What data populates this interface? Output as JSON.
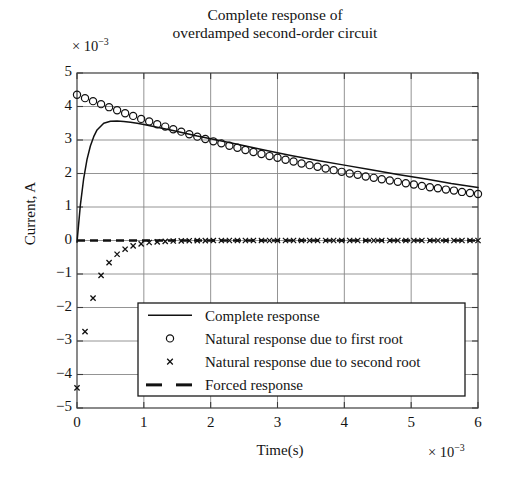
{
  "figure": {
    "title_lines": [
      "Complete response of",
      "overdamped second-order circuit"
    ],
    "y_multiplier": "× 10",
    "y_multiplier_exp": "−3",
    "x_multiplier": "× 10",
    "x_multiplier_exp": "−3",
    "xlabel": "Time(s)",
    "ylabel": "Current, A"
  },
  "axis": {
    "y_ticks": [
      "5",
      "4",
      "3",
      "2",
      "1",
      "0",
      "−1",
      "−2",
      "−3",
      "−4",
      "−5"
    ],
    "x_ticks": [
      "0",
      "1",
      "2",
      "3",
      "4",
      "5",
      "6"
    ]
  },
  "legend": {
    "items": [
      {
        "label": "Complete response",
        "marker": "line"
      },
      {
        "label": "Natural response due to first root",
        "marker": "circle"
      },
      {
        "label": "Natural response due to second root",
        "marker": "cross"
      },
      {
        "label": "Forced response",
        "marker": "dashed"
      }
    ]
  },
  "colors": {
    "axis": "#3c3c3c",
    "grid": "#888888",
    "series": "#111111",
    "background": "#ffffff"
  },
  "chart_data": {
    "type": "line",
    "title": "Complete response of overdamped second-order circuit",
    "xlabel": "Time(s)",
    "ylabel": "Current, A",
    "x_multiplier": 0.001,
    "y_multiplier": 0.001,
    "xlim": [
      0,
      6
    ],
    "ylim": [
      -5,
      5
    ],
    "xticks": [
      0,
      1,
      2,
      3,
      4,
      5,
      6
    ],
    "yticks": [
      -5,
      -4,
      -3,
      -2,
      -1,
      0,
      1,
      2,
      3,
      4,
      5
    ],
    "grid": true,
    "legend_position": "lower-center",
    "series": [
      {
        "name": "Complete response",
        "style": "solid-line",
        "x": [
          0,
          0.05,
          0.1,
          0.15,
          0.2,
          0.25,
          0.3,
          0.4,
          0.5,
          0.6,
          0.7,
          0.8,
          0.9,
          1.0,
          1.2,
          1.4,
          1.6,
          1.8,
          2.0,
          2.4,
          2.8,
          3.2,
          3.6,
          4.0,
          4.4,
          4.8,
          5.2,
          5.6,
          6.0
        ],
        "y": [
          -0.05,
          1.05,
          1.85,
          2.42,
          2.82,
          3.1,
          3.3,
          3.5,
          3.56,
          3.57,
          3.55,
          3.53,
          3.5,
          3.46,
          3.38,
          3.3,
          3.21,
          3.12,
          3.04,
          2.87,
          2.7,
          2.54,
          2.39,
          2.25,
          2.11,
          1.97,
          1.84,
          1.7,
          1.58
        ]
      },
      {
        "name": "Natural response due to first root",
        "style": "circle-markers",
        "x": [
          0,
          0.12,
          0.24,
          0.36,
          0.48,
          0.6,
          0.72,
          0.84,
          0.96,
          1.08,
          1.2,
          1.32,
          1.44,
          1.56,
          1.68,
          1.8,
          1.92,
          2.04,
          2.16,
          2.28,
          2.4,
          2.52,
          2.64,
          2.76,
          2.88,
          3.0,
          3.12,
          3.24,
          3.36,
          3.48,
          3.6,
          3.72,
          3.84,
          3.96,
          4.08,
          4.2,
          4.32,
          4.44,
          4.56,
          4.68,
          4.8,
          4.92,
          5.04,
          5.16,
          5.28,
          5.4,
          5.52,
          5.64,
          5.76,
          5.88,
          6.0
        ],
        "y": [
          4.35,
          4.25,
          4.16,
          4.07,
          3.98,
          3.89,
          3.8,
          3.72,
          3.63,
          3.55,
          3.47,
          3.4,
          3.32,
          3.25,
          3.17,
          3.1,
          3.03,
          2.96,
          2.9,
          2.83,
          2.77,
          2.7,
          2.64,
          2.58,
          2.52,
          2.47,
          2.41,
          2.36,
          2.3,
          2.25,
          2.2,
          2.15,
          2.1,
          2.05,
          2.0,
          1.96,
          1.91,
          1.87,
          1.83,
          1.79,
          1.75,
          1.71,
          1.67,
          1.63,
          1.59,
          1.56,
          1.52,
          1.49,
          1.45,
          1.42,
          1.39
        ]
      },
      {
        "name": "Natural response due to second root",
        "style": "cross-markers",
        "x": [
          0,
          0.12,
          0.24,
          0.36,
          0.48,
          0.6,
          0.72,
          0.84,
          0.96,
          1.08,
          1.2,
          1.32,
          1.44,
          1.56,
          1.68,
          1.8,
          1.92,
          2.04,
          2.16,
          2.28,
          2.4,
          2.52,
          2.64,
          2.76,
          2.88,
          3.0,
          3.12,
          3.24,
          3.36,
          3.48,
          3.6,
          3.72,
          3.84,
          3.96,
          4.08,
          4.2,
          4.32,
          4.44,
          4.56,
          4.68,
          4.8,
          4.92,
          5.04,
          5.16,
          5.28,
          5.4,
          5.52,
          5.64,
          5.76,
          5.88,
          6.0
        ],
        "y": [
          -4.4,
          -2.72,
          -1.72,
          -1.04,
          -0.66,
          -0.41,
          -0.26,
          -0.16,
          -0.1,
          -0.06,
          -0.04,
          -0.025,
          -0.015,
          -0.01,
          -0.006,
          -0.004,
          -0.002,
          -0.001,
          -0.001,
          0,
          0,
          0,
          0,
          0,
          0,
          0,
          0,
          0,
          0,
          0,
          0,
          0,
          0,
          0,
          0,
          0,
          0,
          0,
          0,
          0,
          0,
          0,
          0,
          0,
          0,
          0,
          0,
          0,
          0,
          0,
          0
        ]
      },
      {
        "name": "Forced response",
        "style": "dashed-line",
        "x": [
          0,
          6
        ],
        "y": [
          0,
          0
        ]
      }
    ]
  }
}
